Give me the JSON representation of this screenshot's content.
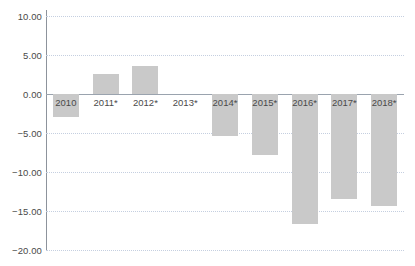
{
  "chart_data": {
    "type": "bar",
    "title": "",
    "subtitle": "",
    "xlabel": "",
    "ylabel": "",
    "categories": [
      "2010",
      "2011*",
      "2012*",
      "2013*",
      "2014*",
      "2015*",
      "2016*",
      "2017*",
      "2018*"
    ],
    "values": [
      -2.9,
      2.6,
      3.6,
      0.0,
      -5.4,
      -7.8,
      -16.7,
      -13.5,
      -14.4
    ],
    "series": [
      {
        "name": "",
        "values": [
          -2.9,
          2.6,
          3.6,
          0.0,
          -5.4,
          -7.8,
          -16.7,
          -13.5,
          -14.4
        ]
      }
    ],
    "ylim": [
      -20.0,
      10.0
    ],
    "y_ticks": [
      10.0,
      5.0,
      0.0,
      -5.0,
      -10.0,
      -15.0,
      -20.0
    ],
    "y_tick_labels": [
      "10.00",
      "5.00",
      "0.00",
      "−5.00",
      "−10.00",
      "−15.00",
      "−20.00"
    ],
    "grid": true,
    "legend": "none",
    "bar_color": "#c9c9c9",
    "gridline_color": "#c5cfe0",
    "zero_line_color": "#9aa3ae",
    "axis_color": "#8d939c",
    "text_color": "#4a4a4a",
    "background": "#ffffff"
  }
}
